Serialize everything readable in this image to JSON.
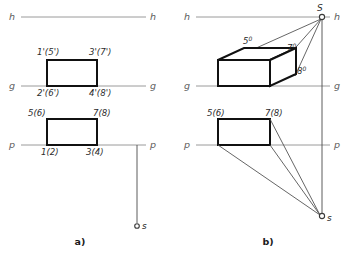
{
  "figure": {
    "panels": [
      {
        "id": "a",
        "caption": "a)",
        "axis_labels": {
          "h_left": "h",
          "h_right": "h",
          "g_left": "g",
          "g_right": "g",
          "p_left": "p",
          "p_right": "p"
        },
        "upper_rect_labels": {
          "top_left": "1'(5')",
          "top_right": "3'(7')",
          "bottom_left": "2'(6')",
          "bottom_right": "4'(8')"
        },
        "lower_rect_labels": {
          "top_left": "5(6)",
          "top_right": "7(8)",
          "bottom_left": "1(2)",
          "bottom_right": "3(4)"
        },
        "source_point_label": "s"
      },
      {
        "id": "b",
        "caption": "b)",
        "axis_labels": {
          "h_left": "h",
          "h_right": "h",
          "g_left": "g",
          "g_right": "g",
          "p_left": "p",
          "p_right": "p"
        },
        "shadow_labels": {
          "vertex_5": "5",
          "vertex_5_sup": "0",
          "vertex_7": "7",
          "vertex_7_sup": "0",
          "vertex_8": "8",
          "vertex_8_sup": "0"
        },
        "lower_rect_labels": {
          "top_left": "5(6)",
          "top_right": "7(8)"
        },
        "source_point_upper_label": "S",
        "source_point_lower_label": "s"
      }
    ],
    "colors": {
      "background": "#ffffff",
      "reference_line": "#9a9a9a",
      "projection_line": "#555555",
      "solid_edge": "#111111",
      "text": "#2b2b2b",
      "axis_text": "#5d5d5d"
    }
  }
}
